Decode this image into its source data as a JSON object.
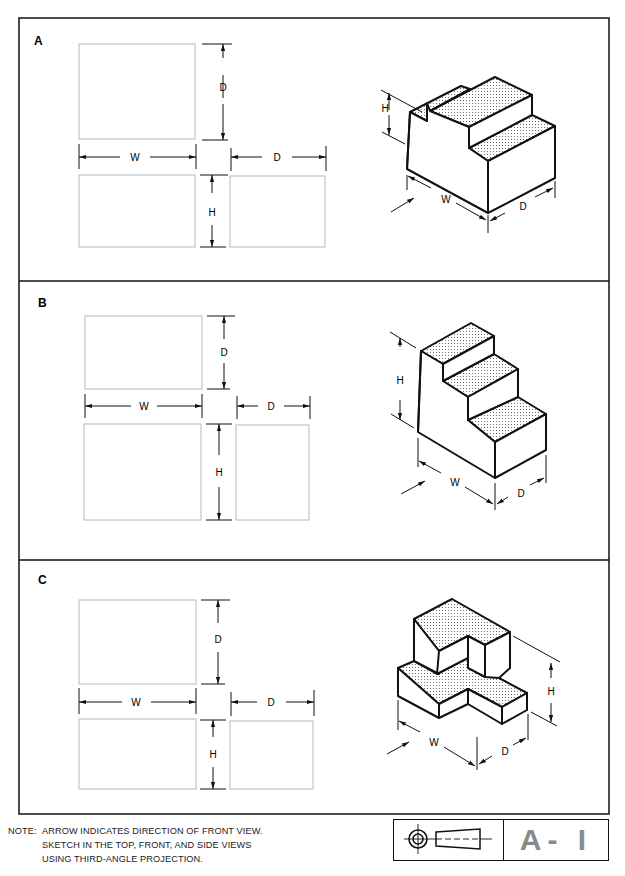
{
  "sheet": {
    "id": "A-1",
    "panels": [
      {
        "label": "A",
        "dims": {
          "top_depth": "D",
          "width": "W",
          "side_depth": "D",
          "height": "H"
        },
        "iso_dims": {
          "height": "H",
          "width": "W",
          "depth": "D"
        }
      },
      {
        "label": "B",
        "dims": {
          "top_depth": "D",
          "width": "W",
          "side_depth": "D",
          "height": "H"
        },
        "iso_dims": {
          "height": "H",
          "width": "W",
          "depth": "D"
        }
      },
      {
        "label": "C",
        "dims": {
          "top_depth": "D",
          "width": "W",
          "side_depth": "D",
          "height": "H"
        },
        "iso_dims": {
          "height": "H",
          "width": "W",
          "depth": "D"
        }
      }
    ],
    "note": {
      "heading": "NOTE:",
      "lines": [
        "ARROW INDICATES DIRECTION OF FRONT VIEW.",
        "SKETCH IN THE TOP, FRONT, AND SIDE VIEWS",
        "USING THIRD-ANGLE PROJECTION."
      ]
    },
    "title_block": {
      "symbol": "third-angle-projection-symbol",
      "sheet_number": "A- I"
    },
    "colors": {
      "ink": "#111111",
      "box_outline": "#b8b8b8",
      "stipple": "#555555",
      "sheet_number": "#8a8a8a"
    }
  }
}
